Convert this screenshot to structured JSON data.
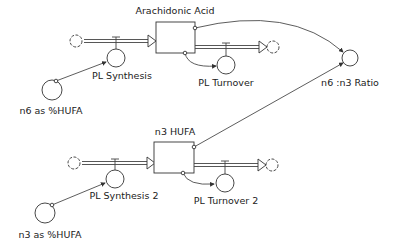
{
  "diagram": {
    "type": "stock-and-flow",
    "stocks": [
      {
        "id": "arachidonic",
        "label": "Arachidonic Acid"
      },
      {
        "id": "n3hufa",
        "label": "n3 HUFA"
      }
    ],
    "flows": [
      {
        "id": "pl_synthesis",
        "label": "PL Synthesis"
      },
      {
        "id": "pl_turnover",
        "label": "PL Turnover"
      },
      {
        "id": "pl_synthesis2",
        "label": "PL Synthesis 2"
      },
      {
        "id": "pl_turnover2",
        "label": "PL Turnover 2"
      }
    ],
    "converters": [
      {
        "id": "n6_pct",
        "label": "n6 as %HUFA"
      },
      {
        "id": "n3_pct",
        "label": "n3 as %HUFA"
      },
      {
        "id": "ratio",
        "label": "n6 :n3 Ratio"
      }
    ]
  }
}
